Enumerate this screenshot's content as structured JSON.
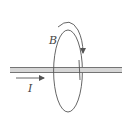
{
  "diagram": {
    "type": "physics-magnetic-field-around-wire",
    "labels": {
      "field": "B",
      "current": "I"
    },
    "colors": {
      "stroke": "#555555",
      "wire_fill": "#cfcfcf"
    }
  }
}
